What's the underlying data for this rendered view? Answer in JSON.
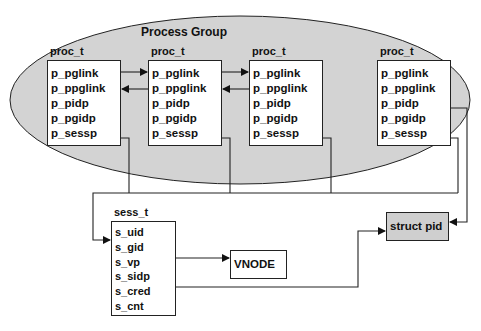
{
  "diagram": {
    "group_label": "Process Group",
    "proc_boxes": [
      {
        "title": "proc_t",
        "fields": [
          "p_pglink",
          "p_ppglink",
          "p_pidp",
          "p_pgidp",
          "p_sessp"
        ]
      },
      {
        "title": "proc_t",
        "fields": [
          "p_pglink",
          "p_ppglink",
          "p_pidp",
          "p_pgidp",
          "p_sessp"
        ]
      },
      {
        "title": "proc_t",
        "fields": [
          "p_pglink",
          "p_ppglink",
          "p_pidp",
          "p_pgidp",
          "p_sessp"
        ]
      },
      {
        "title": "proc_t",
        "fields": [
          "p_pglink",
          "p_ppglink",
          "p_pidp",
          "p_pgidp",
          "p_sessp"
        ]
      }
    ],
    "sess_box": {
      "title": "sess_t",
      "fields": [
        "s_uid",
        "s_gid",
        "s_vp",
        "s_sidp",
        "s_cred",
        "s_cnt"
      ]
    },
    "vnode_label": "VNODE",
    "struct_pid_label": "struct pid",
    "colors": {
      "group_fill": "#d3d3d3",
      "struct_pid_fill": "#cfcfcf",
      "line": "#222222"
    }
  }
}
